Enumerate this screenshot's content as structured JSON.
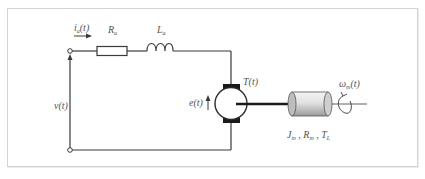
{
  "diagram": {
    "type": "dc-motor-circuit",
    "labels": {
      "current": "i_a(t)",
      "current_main": "i",
      "current_sub": "a",
      "current_arg": "(t)",
      "resistor_main": "R",
      "resistor_sub": "a",
      "inductor_main": "L",
      "inductor_sub": "a",
      "voltage": "v(t)",
      "back_emf": "e(t)",
      "torque": "T(t)",
      "speed_main": "ω",
      "speed_sub": "m",
      "speed_arg": "(t)",
      "load_J": "J",
      "load_J_sub": "m",
      "load_R": "R",
      "load_R_sub": "m",
      "load_T": "T",
      "load_T_sub": "L",
      "sep": " , "
    },
    "components": [
      "input-terminals",
      "resistor",
      "inductor",
      "dc-motor",
      "shaft",
      "load-inertia",
      "rotation-indicator"
    ],
    "colors": {
      "wire": "#3a3a3a",
      "frame": "#d4d4d4",
      "text": "#555555",
      "brush": "#1a1a1a",
      "load": "#d8d8d8"
    }
  }
}
